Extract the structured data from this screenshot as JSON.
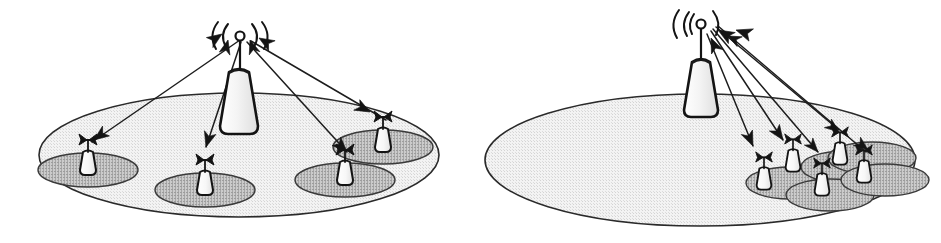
{
  "figure": {
    "width": 941,
    "height": 243,
    "background_color": "#ffffff",
    "ink_color": "#141414",
    "footprint_fill": "#ededed",
    "footprint_stroke": "#2a2a2a",
    "spot_fill": "#b8b8b8",
    "spot_stroke": "#3a3a3a",
    "tower_fill": "#f2f2f2",
    "terminal_fill": "#fafafa"
  },
  "panels": [
    {
      "id": "panel-left",
      "name": "uniform-distribution-panel",
      "label": "",
      "footprint": {
        "cx": 239,
        "cy": 155,
        "rx": 200,
        "ry": 62
      },
      "hub": {
        "name": "satellite-gateway-tower",
        "base_x": 239,
        "base_y": 133,
        "top_y": 72,
        "mast_top_y": 34,
        "knob_r": 5,
        "half_width_bottom": 19,
        "half_width_top": 10,
        "waves": [
          "left-outer",
          "left-inner",
          "right-inner",
          "right-outer"
        ]
      },
      "spots": [
        {
          "name": "spot-beam-1",
          "cx": 88,
          "cy": 170,
          "rx": 50,
          "ry": 17
        },
        {
          "name": "spot-beam-2",
          "cx": 205,
          "cy": 190,
          "rx": 50,
          "ry": 17
        },
        {
          "name": "spot-beam-3",
          "cx": 345,
          "cy": 180,
          "rx": 50,
          "ry": 17
        },
        {
          "name": "spot-beam-4",
          "cx": 383,
          "cy": 147,
          "rx": 50,
          "ry": 17
        }
      ],
      "terminals": [
        {
          "name": "user-terminal-1",
          "x": 88,
          "y": 170,
          "scale": 1.0
        },
        {
          "name": "user-terminal-2",
          "x": 205,
          "y": 190,
          "scale": 1.0
        },
        {
          "name": "user-terminal-3",
          "x": 345,
          "y": 180,
          "scale": 1.0
        },
        {
          "name": "user-terminal-4",
          "x": 383,
          "y": 147,
          "scale": 1.0
        }
      ],
      "beams": [
        {
          "name": "beam-link-1",
          "x1": 240,
          "y1": 40,
          "x2": 92,
          "y2": 142,
          "head": "both",
          "head_out_angle": 215,
          "head_in_angle": 35
        },
        {
          "name": "beam-link-2",
          "x1": 241,
          "y1": 42,
          "x2": 206,
          "y2": 147,
          "head": "out",
          "head_out_angle": 252
        },
        {
          "name": "beam-link-3",
          "x1": 247,
          "y1": 42,
          "x2": 347,
          "y2": 152,
          "head": "both",
          "head_out_angle": 312,
          "head_in_angle": 132
        },
        {
          "name": "beam-link-4",
          "x1": 251,
          "y1": 41,
          "x2": 386,
          "y2": 120,
          "head": "both",
          "head_out_angle": 300,
          "head_in_angle": 120
        }
      ]
    },
    {
      "id": "panel-right",
      "name": "clustered-distribution-panel",
      "label": "",
      "footprint": {
        "cx": 700,
        "cy": 160,
        "rx": 215,
        "ry": 66
      },
      "hub": {
        "name": "satellite-gateway-tower",
        "base_x": 701,
        "base_y": 117,
        "top_y": 62,
        "mast_top_y": 24,
        "knob_r": 5,
        "half_width_bottom": 18,
        "half_width_top": 10,
        "waves": [
          "left-outer",
          "left-inner",
          "left-mid",
          "right-inner"
        ]
      },
      "spots": [
        {
          "name": "spot-beam-1",
          "cx": 790,
          "cy": 183,
          "rx": 44,
          "ry": 16
        },
        {
          "name": "spot-beam-2",
          "cx": 830,
          "cy": 195,
          "rx": 44,
          "ry": 16
        },
        {
          "name": "spot-beam-3",
          "cx": 845,
          "cy": 167,
          "rx": 44,
          "ry": 16
        },
        {
          "name": "spot-beam-4",
          "cx": 885,
          "cy": 180,
          "rx": 44,
          "ry": 16
        },
        {
          "name": "spot-beam-5",
          "cx": 872,
          "cy": 158,
          "rx": 44,
          "ry": 16
        }
      ],
      "terminals": [
        {
          "name": "user-terminal-1",
          "x": 764,
          "y": 185,
          "scale": 0.92
        },
        {
          "name": "user-terminal-2",
          "x": 793,
          "y": 167,
          "scale": 0.92
        },
        {
          "name": "user-terminal-3",
          "x": 822,
          "y": 191,
          "scale": 0.92
        },
        {
          "name": "user-terminal-4",
          "x": 840,
          "y": 160,
          "scale": 0.92
        },
        {
          "name": "user-terminal-5",
          "x": 864,
          "y": 178,
          "scale": 0.92
        }
      ],
      "beams": [
        {
          "name": "beam-link-1",
          "x1": 707,
          "y1": 34,
          "x2": 753,
          "y2": 146,
          "head": "out",
          "head_out_angle": 248
        },
        {
          "name": "beam-link-2",
          "x1": 711,
          "y1": 31,
          "x2": 783,
          "y2": 140,
          "head": "out",
          "head_out_angle": 236
        },
        {
          "name": "beam-link-3",
          "x1": 713,
          "y1": 29,
          "x2": 818,
          "y2": 152,
          "head": "both",
          "head_out_angle": 230,
          "head_in_angle": 50
        },
        {
          "name": "beam-link-4",
          "x1": 716,
          "y1": 27,
          "x2": 839,
          "y2": 130,
          "head": "both",
          "head_out_angle": 220,
          "head_in_angle": 40
        },
        {
          "name": "beam-link-5",
          "x1": 718,
          "y1": 26,
          "x2": 866,
          "y2": 152,
          "head": "both",
          "head_out_angle": 220,
          "head_in_angle": 40
        }
      ]
    }
  ]
}
